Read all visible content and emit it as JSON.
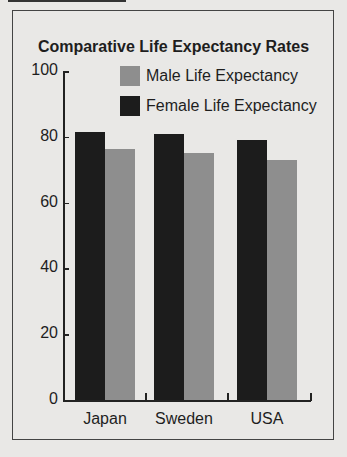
{
  "chart_data": {
    "type": "bar",
    "title": "Comparative Life Expectancy Rates",
    "categories": [
      "Japan",
      "Sweden",
      "USA"
    ],
    "series": [
      {
        "name": "Female Life Expectancy",
        "color": "#1c1c1c",
        "values": [
          81.5,
          81,
          79
        ]
      },
      {
        "name": "Male Life Expectancy",
        "color": "#8e8e8e",
        "values": [
          76.3,
          75,
          73
        ]
      }
    ],
    "xlabel": "",
    "ylabel": "",
    "ylim": [
      0,
      100
    ],
    "yticks": [
      "0",
      "20",
      "40",
      "60",
      "80",
      "100"
    ],
    "grid": false,
    "legend_position": "top-right"
  },
  "legend": {
    "male": "Male Life Expectancy",
    "female": "Female Life Expectancy"
  }
}
